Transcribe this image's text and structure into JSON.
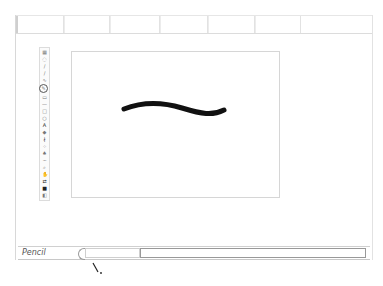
{
  "tabbar": {
    "tabs": [
      {
        "label": "",
        "width": 48
      },
      {
        "label": "",
        "width": 46
      },
      {
        "label": "",
        "width": 50
      },
      {
        "label": "",
        "width": 48
      },
      {
        "label": "",
        "width": 47
      },
      {
        "label": "",
        "width": 46
      }
    ]
  },
  "toolbar": {
    "tools": [
      {
        "name": "select-icon",
        "glyph": "▦",
        "state": "normal"
      },
      {
        "name": "lasso-icon",
        "glyph": "◌",
        "state": "normal"
      },
      {
        "name": "pen-icon",
        "glyph": "/",
        "state": "normal"
      },
      {
        "name": "brush-icon",
        "glyph": "∕",
        "state": "normal"
      },
      {
        "name": "bezier-icon",
        "glyph": "∿",
        "state": "normal"
      },
      {
        "name": "pencil-icon",
        "glyph": "✎",
        "state": "selected"
      },
      {
        "name": "eraser-icon",
        "glyph": "▭",
        "state": "normal"
      },
      {
        "name": "line-icon",
        "glyph": "—",
        "state": "normal"
      },
      {
        "name": "rectangle-icon",
        "glyph": "□",
        "state": "normal"
      },
      {
        "name": "ellipse-icon",
        "glyph": "○",
        "state": "normal"
      },
      {
        "name": "text-icon",
        "glyph": "A",
        "state": "dark"
      },
      {
        "name": "fill-icon",
        "glyph": "◆",
        "state": "normal"
      },
      {
        "name": "dropper-icon",
        "glyph": "∤",
        "state": "dark"
      },
      {
        "name": "spray-icon",
        "glyph": "⁘",
        "state": "normal"
      },
      {
        "name": "stamp-icon",
        "glyph": "♠",
        "state": "normal"
      },
      {
        "name": "smudge-icon",
        "glyph": "~",
        "state": "normal"
      },
      {
        "name": "zoom-icon",
        "glyph": "⌕",
        "state": "normal"
      },
      {
        "name": "hand-icon",
        "glyph": "✋",
        "state": "normal"
      },
      {
        "name": "swap-colors-icon",
        "glyph": "⇄",
        "state": "dark"
      },
      {
        "name": "color-swatch-icon",
        "glyph": "■",
        "state": "dark"
      },
      {
        "name": "reset-colors-icon",
        "glyph": "◧",
        "state": "normal"
      }
    ]
  },
  "canvas": {
    "background": "#ffffff",
    "stroke": {
      "color": "#111111",
      "width": 5,
      "path": "M52 57 C 70 50, 90 50, 110 56 C 130 62, 140 64, 152 58"
    }
  },
  "statusbar": {
    "tool_label": "Pencil"
  },
  "colors": {
    "border": "#d6d6d6",
    "stroke": "#111111",
    "text": "#555555"
  }
}
